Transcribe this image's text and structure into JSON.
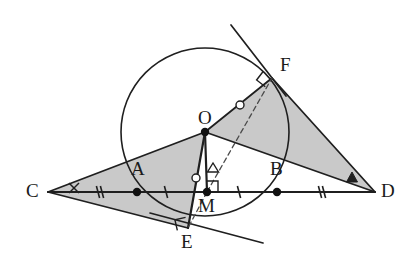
{
  "figure": {
    "type": "geometry-diagram",
    "background": "#ffffff",
    "stroke_color": "#1f1f1f",
    "fill_color": "#c9c9c9",
    "dash_color": "#4a4a4a",
    "width": 404,
    "height": 271
  },
  "points": [
    {
      "id": "C",
      "label": "C",
      "x": 48,
      "y": 192,
      "dot": false,
      "label_dx": -22,
      "label_dy": -11
    },
    {
      "id": "A",
      "label": "A",
      "x": 137,
      "y": 192,
      "dot": true,
      "label_dx": -6,
      "label_dy": -33
    },
    {
      "id": "M",
      "label": "M",
      "x": 207,
      "y": 192,
      "dot": true,
      "label_dx": -9,
      "label_dy": 4
    },
    {
      "id": "B",
      "label": "B",
      "x": 277,
      "y": 192,
      "dot": true,
      "label_dx": -7,
      "label_dy": -33
    },
    {
      "id": "D",
      "label": "D",
      "x": 375,
      "y": 192,
      "dot": false,
      "label_dx": 6,
      "label_dy": -11
    },
    {
      "id": "O",
      "label": "O",
      "x": 205,
      "y": 132,
      "dot": true,
      "label_dx": -7,
      "label_dy": -24
    },
    {
      "id": "E",
      "label": "E",
      "x": 188,
      "y": 228,
      "dot": false,
      "label_dx": -7,
      "label_dy": 4
    },
    {
      "id": "F",
      "label": "F",
      "x": 272,
      "y": 78,
      "dot": false,
      "label_dx": 8,
      "label_dy": -23
    }
  ],
  "circle": {
    "center_x": 205,
    "center_y": 132,
    "radius": 84
  },
  "segments": [
    {
      "name": "line-CD",
      "from": "C",
      "to": "D",
      "style": "solid",
      "width": 2.0
    },
    {
      "name": "line-C-O",
      "from": "C",
      "to": "O",
      "style": "solid",
      "width": 1.8
    },
    {
      "name": "line-C-E",
      "from": "C",
      "to": "E",
      "style": "solid",
      "width": 1.8
    },
    {
      "name": "line-O-E",
      "from": "O",
      "to": "E",
      "style": "solid",
      "width": 2.2
    },
    {
      "name": "line-O-F",
      "from": "O",
      "to": "F",
      "style": "solid",
      "width": 1.8
    },
    {
      "name": "line-O-D",
      "from": "O",
      "to": "D",
      "style": "solid",
      "width": 1.8
    },
    {
      "name": "line-F-D",
      "from": "F",
      "to": "D",
      "style": "solid",
      "width": 1.8
    },
    {
      "name": "line-O-M",
      "from": "O",
      "to": "M",
      "style": "solid",
      "width": 2.2
    },
    {
      "name": "line-M-F",
      "from": "M",
      "to": "F",
      "style": "dashed",
      "width": 1.3
    },
    {
      "name": "line-M-E",
      "from": "M",
      "to": "E",
      "style": "dashed",
      "width": 1.3
    }
  ],
  "tangents": [
    {
      "name": "tangent-at-F",
      "x1": 231,
      "y1": 25,
      "x2": 286,
      "y2": 96
    },
    {
      "name": "tangent-at-E",
      "x1": 150,
      "y1": 213,
      "x2": 263,
      "y2": 243
    }
  ],
  "shaded_regions": [
    {
      "name": "triangle-C-O-E",
      "vertices": "C,O,E"
    },
    {
      "name": "triangle-O-F-D",
      "vertices": "O,F,D"
    }
  ],
  "tick_marks": [
    {
      "name": "tick-segment-CA",
      "x": 100,
      "y": 192,
      "count": 2,
      "label": "double-tick"
    },
    {
      "name": "tick-segment-AM",
      "x": 166,
      "y": 192,
      "count": 1,
      "label": "single-tick"
    },
    {
      "name": "tick-segment-MB",
      "x": 239,
      "y": 192,
      "count": 1,
      "label": "single-tick"
    },
    {
      "name": "tick-segment-BD",
      "x": 322,
      "y": 192,
      "count": 2,
      "label": "double-tick"
    }
  ],
  "angle_marks": [
    {
      "name": "angle-mark-C-cross",
      "glyph": "cross",
      "x": 74,
      "y": 188
    },
    {
      "name": "angle-mark-D-triangle",
      "glyph": "filled-triangle",
      "x": 352,
      "y": 178
    },
    {
      "name": "angle-mark-M-triangle",
      "glyph": "open-triangle",
      "x": 213,
      "y": 169
    },
    {
      "name": "angle-mark-OM-circle",
      "glyph": "open-circle",
      "x": 196,
      "y": 178
    },
    {
      "name": "angle-mark-OF-circle",
      "glyph": "open-circle",
      "x": 240,
      "y": 105
    }
  ],
  "right_angles": [
    {
      "name": "right-angle-at-M",
      "x": 207,
      "y": 192,
      "dir": "up-right"
    },
    {
      "name": "right-angle-at-E",
      "x": 188,
      "y": 228,
      "dir": "up-left"
    },
    {
      "name": "right-angle-at-F",
      "x": 272,
      "y": 78,
      "dir": "down-left"
    }
  ]
}
